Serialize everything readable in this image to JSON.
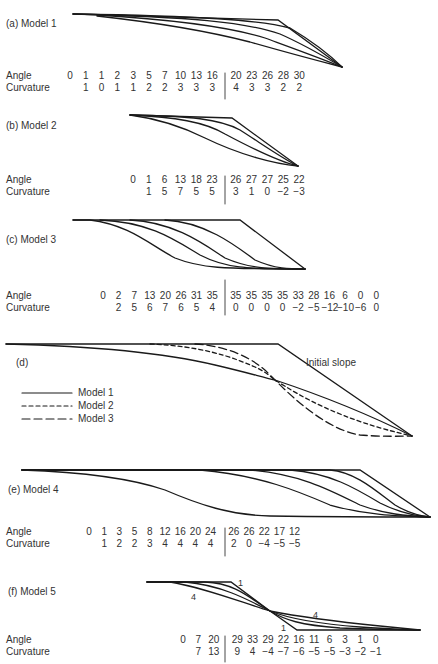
{
  "figure": {
    "panels": [
      {
        "id": "a",
        "label": "(a)  Model 1",
        "angle": [
          "0",
          "1",
          "1",
          "2",
          "3",
          "5",
          "7",
          "10",
          "13",
          "16",
          "20",
          "23",
          "26",
          "28",
          "30"
        ],
        "curvature": [
          "",
          "1",
          "0",
          "1",
          "1",
          "2",
          "2",
          "3",
          "3",
          "3",
          "4",
          "3",
          "3",
          "2",
          "2"
        ]
      },
      {
        "id": "b",
        "label": "(b)  Model 2",
        "angle": [
          "0",
          "1",
          "6",
          "13",
          "18",
          "23",
          "26",
          "27",
          "27",
          "25",
          "22"
        ],
        "curvature": [
          "",
          "1",
          "5",
          "7",
          "5",
          "5",
          "3",
          "1",
          "0",
          "−2",
          "−3"
        ]
      },
      {
        "id": "c",
        "label": "(c)  Model 3",
        "angle": [
          "0",
          "2",
          "7",
          "13",
          "20",
          "26",
          "31",
          "35",
          "35",
          "35",
          "35",
          "35",
          "33",
          "28",
          "16",
          "6",
          "0",
          "0"
        ],
        "curvature": [
          "",
          "2",
          "5",
          "6",
          "7",
          "6",
          "5",
          "4",
          "0",
          "0",
          "0",
          "0",
          "−2",
          "−5",
          "−12",
          "−10",
          "−6",
          "0"
        ]
      },
      {
        "id": "d",
        "label": "(d)",
        "annotation": "Initial slope",
        "legend": [
          "Model 1",
          "Model 2",
          "Model 3"
        ]
      },
      {
        "id": "e",
        "label": "(e)  Model 4",
        "angle": [
          "0",
          "1",
          "3",
          "5",
          "8",
          "12",
          "16",
          "20",
          "24",
          "26",
          "26",
          "22",
          "17",
          "12"
        ],
        "curvature": [
          "",
          "1",
          "2",
          "2",
          "3",
          "4",
          "4",
          "4",
          "4",
          "2",
          "0",
          "−4",
          "−5",
          "−5"
        ]
      },
      {
        "id": "f",
        "label": "(f)  Model 5",
        "curve_marks": [
          "1",
          "4",
          "4",
          "1"
        ],
        "angle": [
          "0",
          "7",
          "20",
          "29",
          "33",
          "29",
          "22",
          "16",
          "11",
          "6",
          "3",
          "1",
          "0"
        ],
        "curvature": [
          "",
          "7",
          "13",
          "9",
          "4",
          "−4",
          "−7",
          "−6",
          "−5",
          "−5",
          "−3",
          "−2",
          "−1"
        ]
      }
    ],
    "row_labels": {
      "angle": "Angle",
      "curvature": "Curvature"
    }
  },
  "chart_data": {
    "type": "line",
    "series": [
      {
        "name": "Model 1",
        "angle": [
          0,
          1,
          1,
          2,
          3,
          5,
          7,
          10,
          13,
          16,
          20,
          23,
          26,
          28,
          30
        ],
        "curvature": [
          null,
          1,
          0,
          1,
          1,
          2,
          2,
          3,
          3,
          3,
          4,
          3,
          3,
          2,
          2
        ]
      },
      {
        "name": "Model 2",
        "angle": [
          0,
          1,
          6,
          13,
          18,
          23,
          26,
          27,
          27,
          25,
          22
        ],
        "curvature": [
          null,
          1,
          5,
          7,
          5,
          5,
          3,
          1,
          0,
          -2,
          -3
        ]
      },
      {
        "name": "Model 3",
        "angle": [
          0,
          2,
          7,
          13,
          20,
          26,
          31,
          35,
          35,
          35,
          35,
          35,
          33,
          28,
          16,
          6,
          0,
          0
        ],
        "curvature": [
          null,
          2,
          5,
          6,
          7,
          6,
          5,
          4,
          0,
          0,
          0,
          0,
          -2,
          -5,
          -12,
          -10,
          -6,
          0
        ]
      },
      {
        "name": "Model 4",
        "angle": [
          0,
          1,
          3,
          5,
          8,
          12,
          16,
          20,
          24,
          26,
          26,
          22,
          17,
          12
        ],
        "curvature": [
          null,
          1,
          2,
          2,
          3,
          4,
          4,
          4,
          4,
          2,
          0,
          -4,
          -5,
          -5
        ]
      },
      {
        "name": "Model 5",
        "angle": [
          0,
          7,
          20,
          29,
          33,
          29,
          22,
          16,
          11,
          6,
          3,
          1,
          0
        ],
        "curvature": [
          null,
          7,
          13,
          9,
          4,
          -4,
          -7,
          -6,
          -5,
          -5,
          -3,
          -2,
          -1
        ]
      }
    ],
    "legend": [
      "Model 1",
      "Model 2",
      "Model 3"
    ],
    "annotations": [
      "Initial slope",
      "1",
      "4"
    ]
  }
}
